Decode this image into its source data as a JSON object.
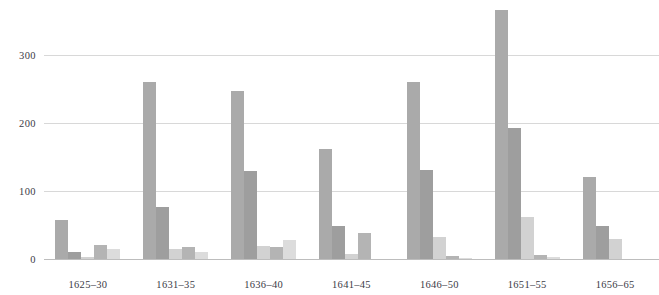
{
  "chart_data": {
    "type": "bar",
    "title": "",
    "subtitle": "",
    "xlabel": "",
    "ylabel": "",
    "categories": [
      "1625–30",
      "1631–35",
      "1636–40",
      "1641–45",
      "1646–50",
      "1651–55",
      "1656–65"
    ],
    "ylim": [
      0,
      380
    ],
    "yticks": [
      0,
      100,
      200,
      300
    ],
    "ytick_labels": [
      "0",
      "100",
      "200",
      "300"
    ],
    "grid": true,
    "legend": "none",
    "series": [
      {
        "name": "series-1",
        "color": "#aaaaaa",
        "values": [
          57,
          259,
          246,
          162,
          259,
          366,
          121
        ]
      },
      {
        "name": "series-2",
        "color": "#9e9e9e",
        "values": [
          10,
          76,
          129,
          49,
          130,
          192,
          48
        ]
      },
      {
        "name": "series-3",
        "color": "#d2d2d2",
        "values": [
          3,
          15,
          19,
          8,
          32,
          62,
          29
        ]
      },
      {
        "name": "series-4",
        "color": "#b4b4b4",
        "values": [
          20,
          18,
          18,
          38,
          4,
          6,
          0
        ]
      },
      {
        "name": "series-5",
        "color": "#dcdcdc",
        "values": [
          14,
          10,
          28,
          0,
          1,
          3,
          0
        ]
      }
    ]
  },
  "style": {
    "background": "#ffffff",
    "gridline_color": "#d8d8d8",
    "axis_color": "#bdbdbd",
    "tick_text_color": "#3b3b46"
  }
}
